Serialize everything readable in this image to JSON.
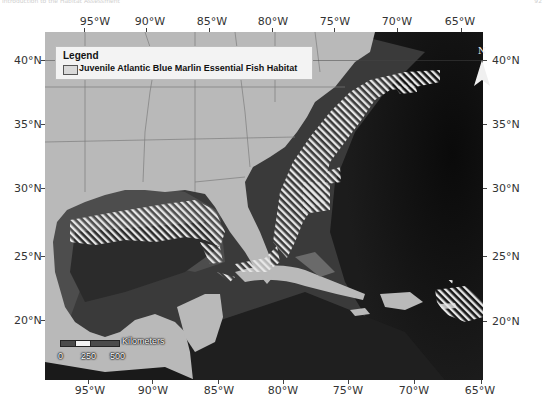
{
  "page": {
    "header_left": "Introduction to the Habitat Assessment",
    "header_right": "92"
  },
  "legend": {
    "title": "Legend",
    "items": [
      {
        "label": "Juvenile Atlantic Blue Marlin Essential Fish Habitat",
        "pattern": "white diagonal hatch"
      }
    ]
  },
  "north_arrow": {
    "label": "N"
  },
  "scale_bar": {
    "unit_label": "Kilometers",
    "ticks": [
      "0",
      "250",
      "500"
    ]
  },
  "axes": {
    "longitude_labels": [
      "95°W",
      "90°W",
      "85°W",
      "80°W",
      "75°W",
      "70°W",
      "65°W"
    ],
    "latitude_labels": [
      "40°N",
      "35°N",
      "30°N",
      "25°N",
      "20°N"
    ]
  },
  "colors": {
    "land": "#b9b9b9",
    "shelf_water": "#5a5a5a",
    "deep_water": "#2a2a2a",
    "abyss": "#0c0c0c",
    "hatch": "#e6e6e6",
    "border_lines": "#7c7c7c"
  }
}
